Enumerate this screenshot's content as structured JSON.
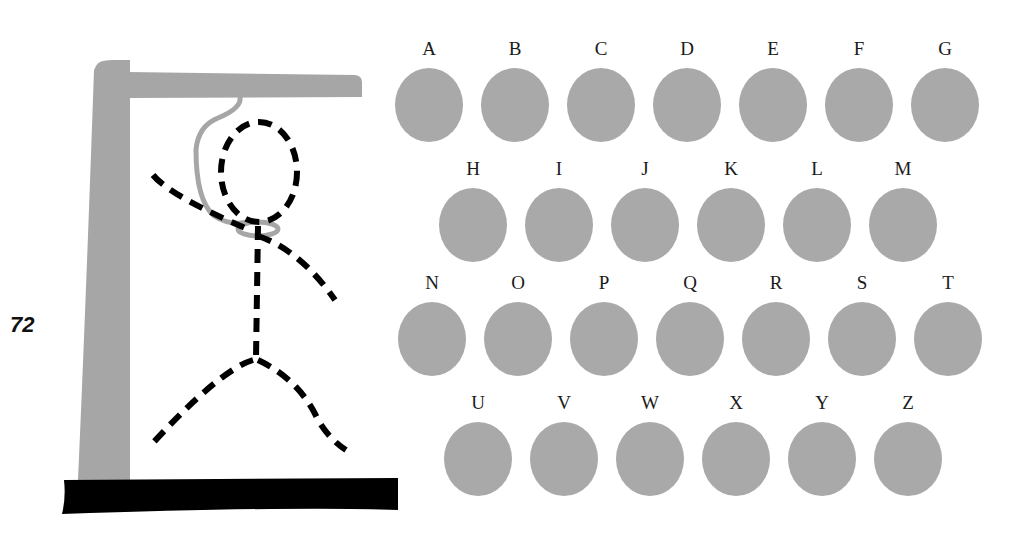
{
  "page": {
    "number": "72"
  },
  "game": {
    "title": "Hangman",
    "colors": {
      "gallows": "#a6a6a6",
      "base": "#000000",
      "rope": "#a6a6a6",
      "figure": "#000000",
      "letter_disc": "#a9a9a9"
    },
    "figure_parts": [
      "head",
      "body",
      "left-arm",
      "right-arm",
      "left-leg",
      "right-leg"
    ],
    "rows": [
      {
        "letters": [
          "A",
          "B",
          "C",
          "D",
          "E",
          "F",
          "G"
        ],
        "x": [
          394,
          480,
          566,
          652,
          738,
          824,
          910
        ],
        "y": 36
      },
      {
        "letters": [
          "H",
          "I",
          "J",
          "K",
          "L",
          "M"
        ],
        "x": [
          438,
          524,
          610,
          696,
          782,
          868
        ],
        "y": 156
      },
      {
        "letters": [
          "N",
          "O",
          "P",
          "Q",
          "R",
          "S",
          "T"
        ],
        "x": [
          397,
          483,
          569,
          655,
          741,
          827,
          913
        ],
        "y": 270
      },
      {
        "letters": [
          "U",
          "V",
          "W",
          "X",
          "Y",
          "Z"
        ],
        "x": [
          443,
          529,
          615,
          701,
          787,
          873
        ],
        "y": 390
      }
    ]
  }
}
